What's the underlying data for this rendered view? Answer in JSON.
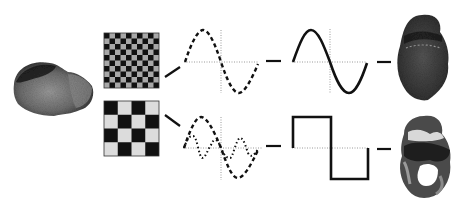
{
  "diagram": {
    "description": "Fourier / spatial-frequency decomposition of a brain-like object into high and low frequency components",
    "source_object": {
      "name": "brain-section-image",
      "shade": "#6a6a6a"
    },
    "rows": [
      {
        "id": "high-frequency",
        "grating": {
          "cells": 10,
          "dark": "#111111",
          "light": "#a8a8a8"
        },
        "input_wave": {
          "style": "dashed",
          "cycles": 1
        },
        "output_wave": {
          "style": "solid-sine"
        },
        "result": {
          "name": "high-frequency-filtered-object"
        }
      },
      {
        "id": "low-frequency",
        "grating": {
          "cells": 4,
          "dark": "#111111",
          "light": "#dcdcdc"
        },
        "input_wave": {
          "style": "dashed+dotted",
          "cycles": [
            1,
            2
          ]
        },
        "output_wave": {
          "style": "solid-square"
        },
        "result": {
          "name": "low-frequency-filtered-object"
        }
      }
    ],
    "colors": {
      "line": "#111111",
      "axis": "#9a9a9a",
      "background": "#ffffff"
    }
  }
}
